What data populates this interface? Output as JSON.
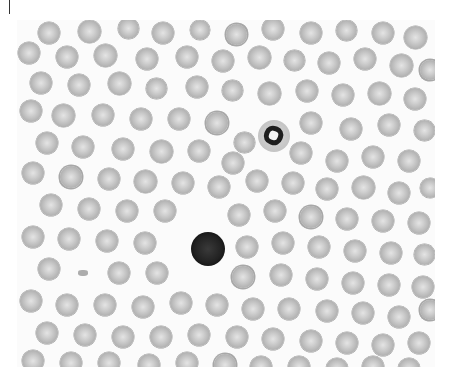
{
  "image": {
    "description": "Peripheral blood smear micrograph (grayscale) showing numerous red blood cells, one neutrophil and one lymphocyte",
    "background": "#fbfbfb",
    "frame": {
      "x": 17,
      "y": 20,
      "width": 418,
      "height": 347
    }
  },
  "white_cells": [
    {
      "type": "neutrophil",
      "x": 258,
      "y": 120,
      "d": 32
    },
    {
      "type": "lymphocyte",
      "x": 191,
      "y": 232,
      "d": 34
    }
  ],
  "debris": [
    {
      "x": 78,
      "y": 270
    }
  ],
  "red_cells": [
    [
      38,
      22,
      22
    ],
    [
      78,
      20,
      23
    ],
    [
      118,
      18,
      21
    ],
    [
      152,
      22,
      22
    ],
    [
      190,
      20,
      20
    ],
    [
      226,
      24,
      21
    ],
    [
      262,
      18,
      22
    ],
    [
      300,
      22,
      22
    ],
    [
      336,
      20,
      21
    ],
    [
      372,
      22,
      22
    ],
    [
      404,
      26,
      23
    ],
    [
      18,
      42,
      22
    ],
    [
      56,
      46,
      22
    ],
    [
      94,
      44,
      23
    ],
    [
      136,
      48,
      22
    ],
    [
      176,
      46,
      22
    ],
    [
      212,
      50,
      22
    ],
    [
      248,
      46,
      23
    ],
    [
      284,
      50,
      21
    ],
    [
      318,
      52,
      22
    ],
    [
      354,
      48,
      22
    ],
    [
      390,
      54,
      23
    ],
    [
      420,
      60,
      20
    ],
    [
      30,
      72,
      22
    ],
    [
      68,
      74,
      22
    ],
    [
      108,
      72,
      23
    ],
    [
      146,
      78,
      21
    ],
    [
      186,
      76,
      22
    ],
    [
      222,
      80,
      21
    ],
    [
      258,
      82,
      23
    ],
    [
      296,
      80,
      22
    ],
    [
      332,
      84,
      22
    ],
    [
      368,
      82,
      23
    ],
    [
      404,
      88,
      22
    ],
    [
      20,
      100,
      22
    ],
    [
      52,
      104,
      23
    ],
    [
      92,
      104,
      22
    ],
    [
      130,
      108,
      22
    ],
    [
      168,
      108,
      22
    ],
    [
      206,
      112,
      22
    ],
    [
      234,
      132,
      21
    ],
    [
      300,
      112,
      22
    ],
    [
      340,
      118,
      22
    ],
    [
      378,
      114,
      22
    ],
    [
      414,
      120,
      21
    ],
    [
      36,
      132,
      22
    ],
    [
      72,
      136,
      22
    ],
    [
      112,
      138,
      22
    ],
    [
      150,
      140,
      23
    ],
    [
      188,
      140,
      22
    ],
    [
      222,
      152,
      22
    ],
    [
      290,
      142,
      22
    ],
    [
      326,
      150,
      22
    ],
    [
      362,
      146,
      22
    ],
    [
      398,
      150,
      22
    ],
    [
      22,
      162,
      22
    ],
    [
      60,
      166,
      22
    ],
    [
      98,
      168,
      22
    ],
    [
      134,
      170,
      23
    ],
    [
      172,
      172,
      22
    ],
    [
      208,
      176,
      22
    ],
    [
      246,
      170,
      22
    ],
    [
      282,
      172,
      22
    ],
    [
      316,
      178,
      22
    ],
    [
      352,
      176,
      23
    ],
    [
      388,
      182,
      22
    ],
    [
      420,
      178,
      20
    ],
    [
      40,
      194,
      22
    ],
    [
      78,
      198,
      22
    ],
    [
      116,
      200,
      22
    ],
    [
      154,
      200,
      22
    ],
    [
      228,
      204,
      22
    ],
    [
      264,
      200,
      22
    ],
    [
      300,
      206,
      22
    ],
    [
      336,
      208,
      22
    ],
    [
      372,
      210,
      22
    ],
    [
      408,
      212,
      22
    ],
    [
      22,
      226,
      22
    ],
    [
      58,
      228,
      22
    ],
    [
      96,
      230,
      22
    ],
    [
      134,
      232,
      22
    ],
    [
      236,
      236,
      22
    ],
    [
      272,
      232,
      22
    ],
    [
      308,
      236,
      22
    ],
    [
      344,
      240,
      22
    ],
    [
      380,
      242,
      22
    ],
    [
      414,
      244,
      21
    ],
    [
      38,
      258,
      22
    ],
    [
      108,
      262,
      22
    ],
    [
      146,
      262,
      22
    ],
    [
      232,
      266,
      22
    ],
    [
      270,
      264,
      22
    ],
    [
      306,
      268,
      22
    ],
    [
      342,
      272,
      22
    ],
    [
      378,
      274,
      22
    ],
    [
      412,
      276,
      22
    ],
    [
      20,
      290,
      22
    ],
    [
      56,
      294,
      22
    ],
    [
      94,
      294,
      22
    ],
    [
      132,
      296,
      22
    ],
    [
      170,
      292,
      22
    ],
    [
      206,
      294,
      22
    ],
    [
      242,
      298,
      22
    ],
    [
      278,
      298,
      22
    ],
    [
      316,
      300,
      22
    ],
    [
      352,
      302,
      22
    ],
    [
      388,
      306,
      22
    ],
    [
      420,
      300,
      20
    ],
    [
      36,
      322,
      22
    ],
    [
      74,
      324,
      22
    ],
    [
      112,
      326,
      22
    ],
    [
      150,
      326,
      22
    ],
    [
      188,
      324,
      22
    ],
    [
      226,
      326,
      22
    ],
    [
      262,
      328,
      22
    ],
    [
      300,
      330,
      22
    ],
    [
      336,
      332,
      22
    ],
    [
      372,
      334,
      22
    ],
    [
      408,
      332,
      22
    ],
    [
      22,
      350,
      22
    ],
    [
      60,
      352,
      22
    ],
    [
      98,
      352,
      22
    ],
    [
      138,
      354,
      22
    ],
    [
      176,
      352,
      22
    ],
    [
      214,
      354,
      22
    ],
    [
      250,
      356,
      22
    ],
    [
      288,
      356,
      22
    ],
    [
      326,
      358,
      22
    ],
    [
      362,
      356,
      22
    ],
    [
      398,
      358,
      22
    ]
  ]
}
